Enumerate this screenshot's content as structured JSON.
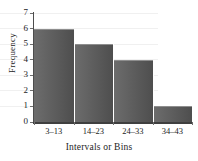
{
  "chart_data": {
    "type": "bar",
    "title": "",
    "subtitle": "",
    "xlabel": "Intervals or Bins",
    "ylabel": "Frequency",
    "categories": [
      "3–13",
      "14–23",
      "24–33",
      "34–43"
    ],
    "values": [
      6,
      5,
      4,
      1
    ],
    "series": [
      {
        "name": "Frequency",
        "values": [
          6,
          5,
          4,
          1
        ]
      }
    ],
    "ylim": [
      0,
      7
    ],
    "yticks": [
      "0",
      "1",
      "2",
      "3",
      "4",
      "5",
      "6",
      "7"
    ],
    "ytick_values": [
      0,
      1,
      2,
      3,
      4,
      5,
      6,
      7
    ],
    "grid": true,
    "grid_axis": "y",
    "legend": false,
    "legend_position": "none",
    "bar_fill_light": "#6d6d6d",
    "bar_fill_dark": "#4e4e4e",
    "bar_edge_color": "#8e8e8e",
    "axis_color": "#3f3f3f",
    "gridline_color": "#f0f0f0",
    "text_color": "#1d1d1d",
    "background_color": "#ffffff",
    "bar_gap": 0
  }
}
